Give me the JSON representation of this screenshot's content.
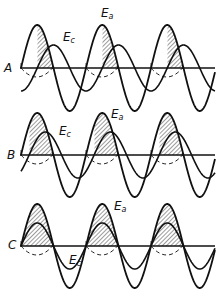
{
  "figure": {
    "panels": [
      {
        "id": "A",
        "letter": "A",
        "anode_label": "E",
        "anode_sub": "a",
        "grid_label": "E",
        "grid_sub": "c",
        "description": "Grid voltage lags plate voltage ~90°; small conduction slivers",
        "baseline_y": 68,
        "ea_amp": 43,
        "ec_amp": 23,
        "ec_phase_deg": -90,
        "ec_offset": 0
      },
      {
        "id": "B",
        "letter": "B",
        "anode_label": "E",
        "anode_sub": "a",
        "grid_label": "E",
        "grid_sub": "c",
        "description": "Grid voltage lags plate voltage ~45°; larger conduction area",
        "baseline_y": 155,
        "ea_amp": 42,
        "ec_amp": 23,
        "ec_phase_deg": -45,
        "ec_offset": 0
      },
      {
        "id": "C",
        "letter": "C",
        "anode_label": "E",
        "anode_sub": "a",
        "grid_label": "E",
        "grid_sub": "c",
        "description": "Grid voltage in phase with plate voltage; full half-cycle conduction",
        "baseline_y": 246,
        "ea_amp": 42,
        "ec_amp": 23,
        "ec_phase_deg": 0,
        "ec_offset": 0
      }
    ],
    "x_start": 21,
    "x_end": 215,
    "period": 65
  }
}
